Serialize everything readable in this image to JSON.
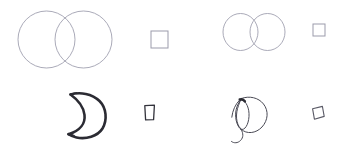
{
  "canvas": {
    "width": 346,
    "height": 152,
    "background": "#ffffff",
    "title": "Sketch shape comparison grid"
  },
  "palette": {
    "light_stroke": "#9b9bab",
    "dark_stroke": "#2b2b33",
    "mid_stroke": "#4a4a55",
    "background": "#ffffff"
  },
  "cells": [
    {
      "id": "top-left",
      "position": "top-left",
      "shapes": [
        {
          "name": "overlapping-circles",
          "type": "venn-two-circles",
          "stroke": "#9b9bab",
          "stroke_width": 0.85,
          "circles": [
            {
              "cx": 46.5,
              "cy": 39.5,
              "r": 28.5
            },
            {
              "cx": 83.5,
              "cy": 39.5,
              "r": 28.5
            }
          ]
        },
        {
          "name": "outline-square",
          "type": "square",
          "stroke": "#9b9bab",
          "stroke_width": 1.0,
          "x": 151,
          "y": 31,
          "width": 17,
          "height": 17
        }
      ]
    },
    {
      "id": "top-right",
      "position": "top-right",
      "shapes": [
        {
          "name": "overlapping-circles",
          "type": "venn-two-circles",
          "stroke": "#9b9bab",
          "stroke_width": 0.85,
          "circles": [
            {
              "cx": 240.5,
              "cy": 32.0,
              "r": 17.5
            },
            {
              "cx": 267.5,
              "cy": 32.0,
              "r": 17.5
            }
          ]
        },
        {
          "name": "outline-square",
          "type": "square",
          "stroke": "#9b9bab",
          "stroke_width": 1.0,
          "x": 313,
          "y": 24,
          "width": 12,
          "height": 12
        }
      ]
    },
    {
      "id": "bottom-left",
      "position": "bottom-left",
      "shapes": [
        {
          "name": "crescent-moon",
          "type": "crescent",
          "stroke": "#2b2b33",
          "stroke_width": 2.6,
          "bbox": {
            "x": 65,
            "y": 92,
            "width": 42,
            "height": 47
          }
        },
        {
          "name": "sketch-square",
          "type": "square-handdrawn",
          "stroke": "#33333c",
          "stroke_width": 1.3,
          "x": 144,
          "y": 105,
          "width": 11,
          "height": 15
        }
      ]
    },
    {
      "id": "bottom-right",
      "position": "bottom-right",
      "shapes": [
        {
          "name": "spiral-coil",
          "type": "coil-sketch",
          "stroke": "#4a4a55",
          "stroke_width": 1.0,
          "bbox": {
            "x": 230,
            "y": 95,
            "width": 40,
            "height": 45
          }
        },
        {
          "name": "tilted-sketch-square",
          "type": "square-rotated",
          "stroke": "#4a4a55",
          "stroke_width": 1.1,
          "x": 310,
          "y": 106,
          "width": 14,
          "height": 14,
          "rotation_deg": 12
        }
      ]
    }
  ]
}
